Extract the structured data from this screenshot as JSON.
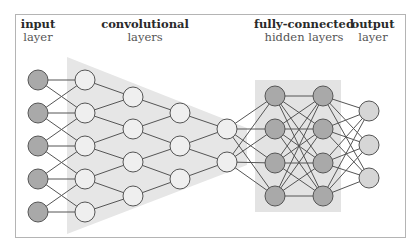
{
  "labels": {
    "input": {
      "bold": "input",
      "regular": "layer"
    },
    "conv": {
      "bold": "convolutional",
      "regular": "layers"
    },
    "fc": {
      "bold": "fully-connected",
      "regular": "hidden layers"
    },
    "output": {
      "bold": "output",
      "regular": "layer"
    }
  },
  "colors": {
    "dark_node": "#a9a9a9",
    "light_node": "#efefef",
    "output_node": "#d6d6d6",
    "node_stroke": "#555555",
    "edge": "#555555",
    "conv_region": "#e6e6e6",
    "fc_region": "#e3e3e3"
  },
  "layers": [
    {
      "name": "input",
      "x": 38,
      "ys": [
        80,
        113,
        146,
        179,
        212
      ],
      "fill": "dark"
    },
    {
      "name": "conv1",
      "x": 85,
      "ys": [
        80,
        113,
        146,
        179,
        212
      ],
      "fill": "light"
    },
    {
      "name": "conv2",
      "x": 133,
      "ys": [
        97,
        129,
        162,
        196
      ],
      "fill": "light"
    },
    {
      "name": "conv3",
      "x": 180,
      "ys": [
        113,
        146,
        179
      ],
      "fill": "light"
    },
    {
      "name": "conv4",
      "x": 227,
      "ys": [
        129,
        162
      ],
      "fill": "light"
    },
    {
      "name": "fc1",
      "x": 275,
      "ys": [
        96,
        129,
        163,
        196
      ],
      "fill": "dark"
    },
    {
      "name": "fc2",
      "x": 323,
      "ys": [
        96,
        129,
        163,
        196
      ],
      "fill": "dark"
    },
    {
      "name": "output",
      "x": 369,
      "ys": [
        111,
        145,
        178
      ],
      "fill": "output"
    }
  ],
  "node_radius": 10
}
